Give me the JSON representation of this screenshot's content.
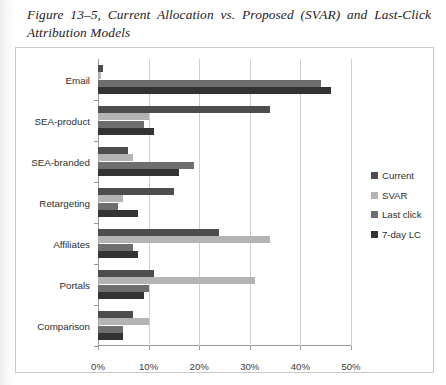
{
  "caption": "Figure 13–5, Current Allocation vs. Proposed (SVAR) and Last-Click Attribution Models",
  "legend": {
    "position": "right",
    "items": [
      {
        "label": "Current",
        "color": "#4d4d4d"
      },
      {
        "label": "SVAR",
        "color": "#b4b4b4"
      },
      {
        "label": "Last click",
        "color": "#6e6e6e"
      },
      {
        "label": "7-day LC",
        "color": "#333333"
      }
    ]
  },
  "chart_data": {
    "type": "bar",
    "orientation": "horizontal",
    "title": "Figure 13–5, Current Allocation vs. Proposed (SVAR) and Last-Click Attribution Models",
    "xlabel": "",
    "ylabel": "",
    "xlim": [
      0,
      50
    ],
    "xticks": [
      0,
      10,
      20,
      30,
      40,
      50
    ],
    "xtick_labels": [
      "0%",
      "10%",
      "20%",
      "30%",
      "40%",
      "50%"
    ],
    "grid": true,
    "grid_axis": "x",
    "categories": [
      "Email",
      "SEA-product",
      "SEA-branded",
      "Retargeting",
      "Affiliates",
      "Portals",
      "Comparison"
    ],
    "series": [
      {
        "name": "Current",
        "color": "#4d4d4d",
        "values": [
          1.0,
          34.0,
          6.0,
          15.0,
          24.0,
          11.0,
          7.0
        ]
      },
      {
        "name": "SVAR",
        "color": "#b4b4b4",
        "values": [
          0.6,
          10.0,
          7.0,
          5.0,
          34.0,
          31.0,
          10.0
        ]
      },
      {
        "name": "Last click",
        "color": "#6e6e6e",
        "values": [
          44.0,
          9.0,
          19.0,
          4.0,
          7.0,
          10.0,
          5.0
        ]
      },
      {
        "name": "7-day LC",
        "color": "#333333",
        "values": [
          46.0,
          11.0,
          16.0,
          8.0,
          8.0,
          9.0,
          5.0
        ]
      }
    ]
  }
}
